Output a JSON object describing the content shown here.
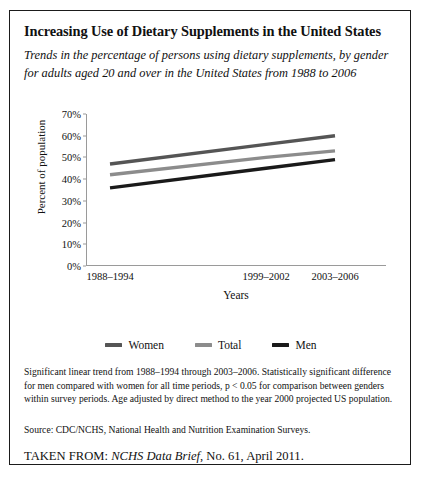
{
  "figure": {
    "title": "Increasing Use of Dietary Supplements in the United States",
    "subtitle": "Trends in the percentage of persons using dietary supplements, by gender for adults aged 20 and over in the United States from 1988 to 2006",
    "notes": "Significant linear trend from 1988–1994 through 2003–2006. Statistically significant difference for men compared with women for all time periods, p < 0.05 for comparison between genders within survey periods. Age adjusted by direct method to the year 2000 projected US population.",
    "source": "Source: CDC/NCHS, National Health and Nutrition Examination Surveys.",
    "taken_from_prefix": "TAKEN FROM:",
    "taken_from_italic": "NCHS Data Brief",
    "taken_from_suffix": ", No. 61, April 2011."
  },
  "chart_data": {
    "type": "line",
    "title": "Increasing Use of Dietary Supplements in the United States",
    "subtitle": "Trends in the percentage of persons using dietary supplements, by gender for adults aged 20 and over in the United States from 1988 to 2006",
    "xlabel": "Years",
    "ylabel": "Percent of population",
    "categories": [
      "1988–1994",
      "1999–2002",
      "2003–2006"
    ],
    "x_positions_pct": [
      8,
      60,
      83
    ],
    "ylim": [
      0,
      70
    ],
    "ytick_labels": [
      "0%",
      "10%",
      "20%",
      "30%",
      "40%",
      "50%",
      "60%",
      "70%"
    ],
    "ytick_values": [
      0,
      10,
      20,
      30,
      40,
      50,
      60,
      70
    ],
    "grid": false,
    "legend_position": "bottom",
    "series": [
      {
        "name": "Women",
        "values": [
          47,
          56,
          60
        ],
        "color": "#555555"
      },
      {
        "name": "Total",
        "values": [
          42,
          50,
          53
        ],
        "color": "#8c8c8c"
      },
      {
        "name": "Men",
        "values": [
          36,
          45,
          49
        ],
        "color": "#1a1a1a"
      }
    ]
  },
  "legend": {
    "items": [
      {
        "label": "Women",
        "color": "#555555"
      },
      {
        "label": "Total",
        "color": "#8c8c8c"
      },
      {
        "label": "Men",
        "color": "#1a1a1a"
      }
    ]
  }
}
